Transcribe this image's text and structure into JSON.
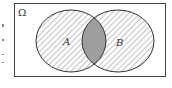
{
  "diagram": {
    "type": "venn",
    "universe_label": "Ω",
    "sets": [
      {
        "label": "A",
        "fill": "hatched"
      },
      {
        "label": "B",
        "fill": "hatched"
      }
    ],
    "intersection": {
      "fill": "#9e9e9e"
    },
    "colors": {
      "stroke": "#333333",
      "hatch": "#555555",
      "background": "#ffffff",
      "frame": "#444444"
    }
  }
}
